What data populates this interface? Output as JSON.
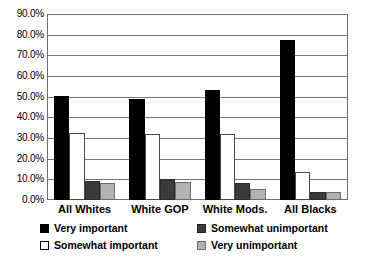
{
  "chart_data": {
    "type": "bar",
    "title": "",
    "xlabel": "",
    "ylabel": "",
    "ylim": [
      0,
      90
    ],
    "grid": true,
    "legend_position": "bottom",
    "categories": [
      "All Whites",
      "White GOP",
      "White Mods.",
      "All Blacks"
    ],
    "ytick_labels": [
      "0.0%",
      "10.0%",
      "20.0%",
      "30.0%",
      "40.0%",
      "50.0%",
      "60.0%",
      "70.0%",
      "80.0%",
      "90.0%"
    ],
    "ytick_values": [
      0,
      10,
      20,
      30,
      40,
      50,
      60,
      70,
      80,
      90
    ],
    "series": [
      {
        "name": "Very important",
        "color": "#000000",
        "values": [
          50.5,
          48.8,
          53.4,
          77.4
        ]
      },
      {
        "name": "Somewhat important",
        "color": "#ffffff",
        "values": [
          32.2,
          32.0,
          31.8,
          13.5
        ]
      },
      {
        "name": "Somewhat unimportant",
        "color": "#3b3b3b",
        "values": [
          9.3,
          10.1,
          8.2,
          4.1
        ]
      },
      {
        "name": "Very unimportant",
        "color": "#b2b2b2",
        "values": [
          8.2,
          8.5,
          5.4,
          3.9
        ]
      }
    ]
  },
  "legend": {
    "items": [
      {
        "label": "Very important"
      },
      {
        "label": "Somewhat unimportant"
      },
      {
        "label": "Somewhat important"
      },
      {
        "label": "Very unimportant"
      }
    ]
  },
  "colors": {
    "very_important": "#000000",
    "somewhat_important": "#ffffff",
    "somewhat_unimportant": "#3b3b3b",
    "very_unimportant": "#b2b2b2",
    "gridline": "#787878",
    "frame": "#6f6f6f",
    "background": "#ffffff"
  }
}
